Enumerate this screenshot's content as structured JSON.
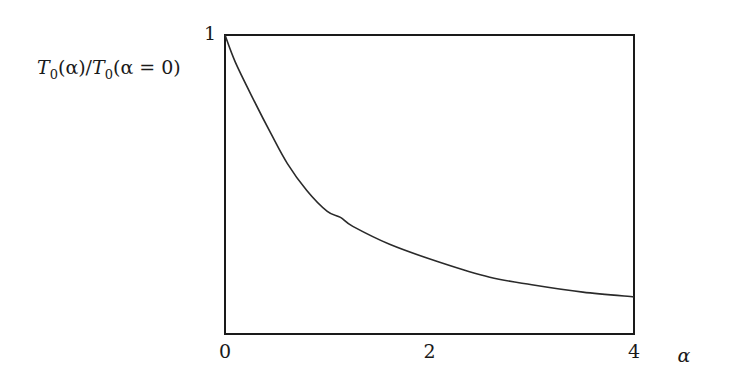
{
  "chart_data": {
    "type": "line",
    "title": "",
    "xlabel": "α",
    "ylabel": "T0(α)/T0(α = 0)",
    "ylabel_parts": {
      "T": "T",
      "sub": "0",
      "mid": "(α)/",
      "T2": "T",
      "sub2": "0",
      "tail": "(α = 0)"
    },
    "xlim": [
      0,
      4
    ],
    "ylim": [
      0,
      1
    ],
    "xticks": [
      0,
      2,
      4
    ],
    "xtick_labels": [
      "0",
      "2",
      "4"
    ],
    "yticks": [
      1
    ],
    "ytick_labels": [
      "1"
    ],
    "grid": false,
    "legend": null,
    "series": [
      {
        "name": "T0(α)/T0(α=0)",
        "x": [
          0.0,
          0.1,
          0.27,
          0.45,
          0.61,
          0.8,
          1.0,
          1.13,
          1.25,
          1.61,
          2.1,
          2.59,
          3.0,
          3.5,
          4.0
        ],
        "y": [
          1.0,
          0.91,
          0.79,
          0.67,
          0.57,
          0.48,
          0.41,
          0.39,
          0.36,
          0.3,
          0.24,
          0.19,
          0.165,
          0.14,
          0.124
        ]
      }
    ]
  },
  "colors": {
    "line": "#2a2a2a",
    "frame": "#1a1a1a",
    "background": "#ffffff"
  }
}
